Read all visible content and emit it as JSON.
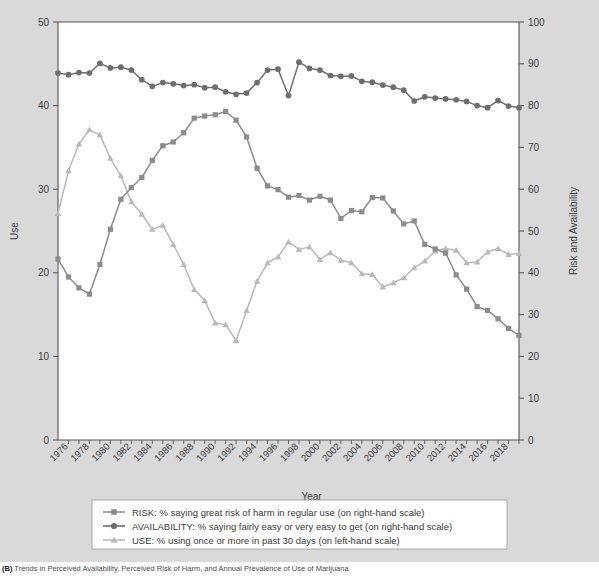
{
  "figure": {
    "background_color": "#d9d9d9",
    "plot_background_color": "#ffffff"
  },
  "caption": {
    "prefix": "(B)",
    "text": " Trends in Perceived Availability, Perceived Risk of Harm, and Annual Prevalence of Use of Marijuana"
  },
  "chart_data": {
    "type": "line",
    "title": "",
    "xlabel": "Year",
    "ylabel": "Use",
    "y2label": "Risk and Availability",
    "xlim": [
      1975,
      2019
    ],
    "ylim": [
      0,
      50
    ],
    "y2lim": [
      0,
      100
    ],
    "yticks": [
      0,
      10,
      20,
      30,
      40,
      50
    ],
    "y2ticks": [
      0,
      10,
      20,
      30,
      40,
      50,
      60,
      70,
      80,
      90,
      100
    ],
    "xticks": [
      1976,
      1978,
      1980,
      1982,
      1984,
      1986,
      1988,
      1990,
      1992,
      1994,
      1996,
      1998,
      2000,
      2002,
      2004,
      2006,
      2008,
      2010,
      2012,
      2014,
      2016,
      2018
    ],
    "xtick_minor_every": 1,
    "grid": false,
    "legend_position": "below-axes",
    "x": [
      1975,
      1976,
      1977,
      1978,
      1979,
      1980,
      1981,
      1982,
      1983,
      1984,
      1985,
      1986,
      1987,
      1988,
      1989,
      1990,
      1991,
      1992,
      1993,
      1994,
      1995,
      1996,
      1997,
      1998,
      1999,
      2000,
      2001,
      2002,
      2003,
      2004,
      2005,
      2006,
      2007,
      2008,
      2009,
      2010,
      2011,
      2012,
      2013,
      2014,
      2015,
      2016,
      2017,
      2018,
      2019
    ],
    "series": [
      {
        "name": "RISK",
        "label": "RISK: % saying great risk of harm in regular use (on right-hand scale)",
        "axis": "right",
        "color": "#8c8c8c",
        "marker": "square",
        "values": [
          43.3,
          39.0,
          36.4,
          34.9,
          42.0,
          50.4,
          57.6,
          60.4,
          62.8,
          66.9,
          70.4,
          71.3,
          73.5,
          77.0,
          77.5,
          77.8,
          78.6,
          76.5,
          72.5,
          65.0,
          60.8,
          59.9,
          58.1,
          58.5,
          57.4,
          58.3,
          57.4,
          53.0,
          54.9,
          54.6,
          58.0,
          57.9,
          54.8,
          51.7,
          52.4,
          46.8,
          45.7,
          44.7,
          39.5,
          36.1,
          31.9,
          31.0,
          29.0,
          26.7,
          25.0
        ]
      },
      {
        "name": "AVAILABILITY",
        "label": "AVAILABILITY: % saying fairly easy or very easy to get (on right-hand scale)",
        "axis": "right",
        "color": "#6e6e6e",
        "marker": "circle",
        "values": [
          87.8,
          87.4,
          87.9,
          87.8,
          90.1,
          89.0,
          89.2,
          88.5,
          86.2,
          84.6,
          85.5,
          85.2,
          84.8,
          85.0,
          84.3,
          84.4,
          83.3,
          82.7,
          83.0,
          85.5,
          88.5,
          88.7,
          82.4,
          90.4,
          88.9,
          88.5,
          87.2,
          87.0,
          87.1,
          85.8,
          85.6,
          84.9,
          84.4,
          83.7,
          81.1,
          82.1,
          81.8,
          81.6,
          81.4,
          81.0,
          80.0,
          79.5,
          81.2,
          79.9,
          79.5
        ]
      },
      {
        "name": "USE",
        "label": "USE: % using once or more in past 30 days (on left-hand scale)",
        "axis": "left",
        "color": "#b9b9b9",
        "marker": "triangle",
        "values": [
          27.1,
          32.2,
          35.4,
          37.1,
          36.5,
          33.7,
          31.6,
          28.5,
          27.0,
          25.2,
          25.7,
          23.4,
          21.0,
          18.0,
          16.7,
          14.0,
          13.8,
          11.9,
          15.5,
          19.0,
          21.2,
          21.9,
          23.7,
          22.8,
          23.1,
          21.6,
          22.4,
          21.5,
          21.2,
          19.9,
          19.8,
          18.3,
          18.8,
          19.4,
          20.6,
          21.4,
          22.6,
          22.9,
          22.7,
          21.2,
          21.3,
          22.5,
          22.9,
          22.2,
          22.3
        ]
      }
    ]
  }
}
